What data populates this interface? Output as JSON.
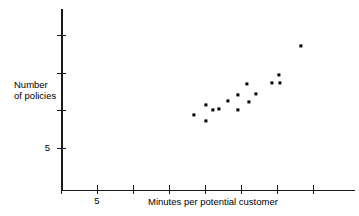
{
  "chart_data": {
    "type": "scatter",
    "title": "",
    "xlabel": "Minutes per potential customer",
    "ylabel": "Number of policies",
    "ylabel_lines": [
      "Number",
      "of policies"
    ],
    "x_tick_labels": [
      "5"
    ],
    "y_tick_labels": [
      "5"
    ],
    "grid": false,
    "legend": null,
    "xlim": [
      3,
      19
    ],
    "ylim": [
      0,
      30
    ],
    "x_ticks": [
      3,
      5,
      7,
      9,
      11,
      13,
      15,
      17
    ],
    "y_ticks": [
      5,
      10,
      15,
      20
    ],
    "points": [
      {
        "x": 10.4,
        "y": 9.1
      },
      {
        "x": 11.1,
        "y": 8.3
      },
      {
        "x": 11.1,
        "y": 10.4
      },
      {
        "x": 11.8,
        "y": 9.6
      },
      {
        "x": 12.5,
        "y": 9.6
      },
      {
        "x": 12.8,
        "y": 10.4
      },
      {
        "x": 13.3,
        "y": 11.1
      },
      {
        "x": 13.3,
        "y": 9.6
      },
      {
        "x": 14.0,
        "y": 10.4
      },
      {
        "x": 13.9,
        "y": 12.9
      },
      {
        "x": 14.6,
        "y": 11.0
      },
      {
        "x": 15.9,
        "y": 12.0
      },
      {
        "x": 16.5,
        "y": 12.9
      },
      {
        "x": 16.6,
        "y": 12.1
      },
      {
        "x": 18.5,
        "y": 14.9
      }
    ],
    "point_pixels": [
      {
        "px": 194,
        "py": 115
      },
      {
        "px": 206,
        "py": 121
      },
      {
        "px": 206,
        "py": 105
      },
      {
        "px": 213,
        "py": 110
      },
      {
        "px": 219,
        "py": 109
      },
      {
        "px": 228,
        "py": 101
      },
      {
        "px": 238,
        "py": 95
      },
      {
        "px": 238,
        "py": 110
      },
      {
        "px": 249,
        "py": 102
      },
      {
        "px": 247,
        "py": 84
      },
      {
        "px": 256,
        "py": 94
      },
      {
        "px": 272,
        "py": 83
      },
      {
        "px": 279,
        "py": 75
      },
      {
        "px": 280,
        "py": 83
      },
      {
        "px": 301,
        "py": 46
      }
    ],
    "colors": {
      "point": "#000000",
      "axis": "#1a1a1a",
      "background": "#ffffff",
      "text": "#000000"
    }
  }
}
